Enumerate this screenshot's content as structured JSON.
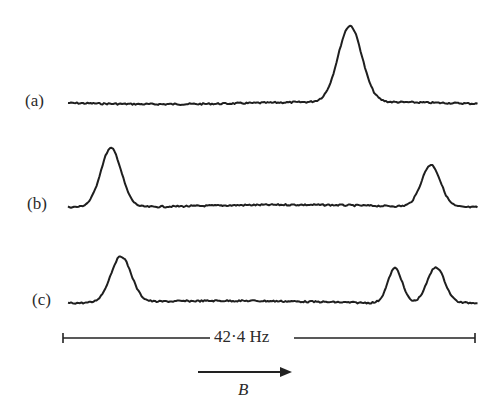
{
  "chart_data": {
    "type": "line",
    "title": "",
    "xlabel": "B",
    "ylabel": "",
    "grid": false,
    "legend": "none",
    "x_range_px": [
      68,
      478
    ],
    "scale_bar": {
      "label": "42·4 Hz",
      "x_start": 63,
      "x_end": 475,
      "y": 338
    },
    "field_arrow": {
      "label": "B",
      "x_start": 198,
      "x_end": 292,
      "y": 372
    },
    "series": [
      {
        "name": "(a)",
        "baseline_y": 103,
        "peaks": [
          {
            "x": 350,
            "top_y": 27,
            "width": 15
          }
        ]
      },
      {
        "name": "(b)",
        "baseline_y": 206,
        "peaks": [
          {
            "x": 111,
            "top_y": 147,
            "width": 13
          },
          {
            "x": 431,
            "top_y": 164,
            "width": 12
          }
        ]
      },
      {
        "name": "(c)",
        "baseline_y": 302,
        "peaks": [
          {
            "x": 121,
            "top_y": 256,
            "width": 13
          },
          {
            "x": 395,
            "top_y": 267,
            "width": 9
          },
          {
            "x": 436,
            "top_y": 266,
            "width": 11
          }
        ]
      }
    ]
  },
  "labels": {
    "a": "(a)",
    "b": "(b)",
    "c": "(c)",
    "scale": "42·4 Hz",
    "field": "B"
  },
  "colors": {
    "ink": "#1f1f1f",
    "background": "#ffffff"
  }
}
